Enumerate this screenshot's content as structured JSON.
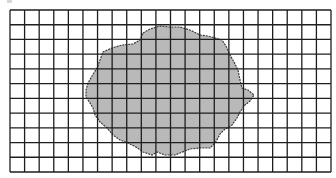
{
  "figure": {
    "type": "grid-area-estimation",
    "grid": {
      "left": 10,
      "top": 10,
      "right": 331,
      "bottom": 172,
      "columns": 22,
      "rows": 11,
      "line_color": "#1e1e1e"
    },
    "shape": {
      "fill_color": "#b9b9b9",
      "outline_color": "#3a3a3a",
      "points": [
        [
          143,
          33
        ],
        [
          150,
          29
        ],
        [
          160,
          26
        ],
        [
          170,
          27
        ],
        [
          180,
          27
        ],
        [
          190,
          30
        ],
        [
          200,
          35
        ],
        [
          208,
          36
        ],
        [
          215,
          38
        ],
        [
          222,
          40
        ],
        [
          226,
          46
        ],
        [
          230,
          55
        ],
        [
          234,
          62
        ],
        [
          238,
          70
        ],
        [
          240,
          80
        ],
        [
          242,
          88
        ],
        [
          248,
          90
        ],
        [
          254,
          95
        ],
        [
          250,
          101
        ],
        [
          245,
          105
        ],
        [
          240,
          112
        ],
        [
          237,
          118
        ],
        [
          232,
          125
        ],
        [
          224,
          130
        ],
        [
          220,
          134
        ],
        [
          218,
          138
        ],
        [
          215,
          143
        ],
        [
          210,
          148
        ],
        [
          200,
          148
        ],
        [
          190,
          149
        ],
        [
          185,
          151
        ],
        [
          175,
          155
        ],
        [
          165,
          155
        ],
        [
          157,
          152
        ],
        [
          152,
          155
        ],
        [
          143,
          152
        ],
        [
          136,
          147
        ],
        [
          128,
          143
        ],
        [
          120,
          140
        ],
        [
          113,
          135
        ],
        [
          107,
          128
        ],
        [
          100,
          122
        ],
        [
          95,
          115
        ],
        [
          93,
          108
        ],
        [
          90,
          103
        ],
        [
          86,
          97
        ],
        [
          86,
          90
        ],
        [
          88,
          83
        ],
        [
          92,
          76
        ],
        [
          97,
          68
        ],
        [
          100,
          60
        ],
        [
          103,
          52
        ],
        [
          112,
          48
        ],
        [
          122,
          45
        ],
        [
          133,
          44
        ],
        [
          140,
          40
        ],
        [
          143,
          33
        ]
      ]
    }
  }
}
